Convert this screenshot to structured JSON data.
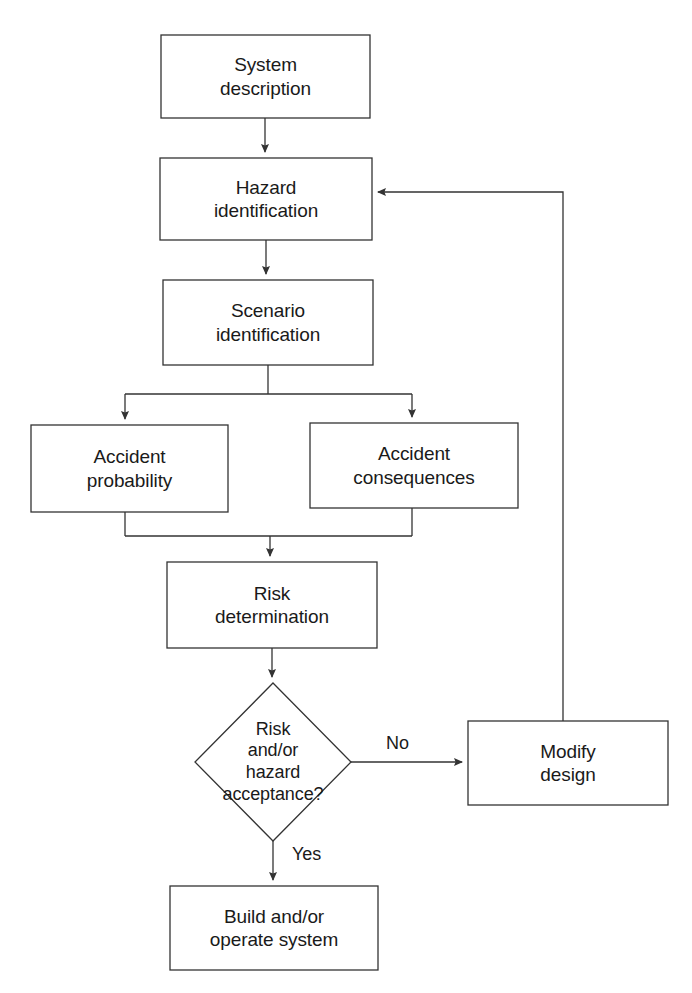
{
  "diagram": {
    "type": "flowchart",
    "stroke_color": "#333333",
    "fill_color": "#ffffff",
    "text_color": "#1a1a1a",
    "background_color": "#ffffff"
  },
  "nodes": {
    "system_description": {
      "label": "System\ndescription",
      "line1": "System",
      "line2": "description",
      "shape": "rectangle",
      "x": 161,
      "y": 35,
      "w": 209,
      "h": 83
    },
    "hazard_identification": {
      "label": "Hazard\nidentification",
      "line1": "Hazard",
      "line2": "identification",
      "shape": "rectangle",
      "x": 160,
      "y": 158,
      "w": 212,
      "h": 82
    },
    "scenario_identification": {
      "label": "Scenario\nidentification",
      "line1": "Scenario",
      "line2": "identification",
      "shape": "rectangle",
      "x": 163,
      "y": 280,
      "w": 210,
      "h": 85
    },
    "accident_probability": {
      "label": "Accident\nprobability",
      "line1": "Accident",
      "line2": "probability",
      "shape": "rectangle",
      "x": 31,
      "y": 425,
      "w": 197,
      "h": 87
    },
    "accident_consequences": {
      "label": "Accident\nconsequences",
      "line1": "Accident",
      "line2": "consequences",
      "shape": "rectangle",
      "x": 310,
      "y": 423,
      "w": 208,
      "h": 85
    },
    "risk_determination": {
      "label": "Risk\ndetermination",
      "line1": "Risk",
      "line2": "determination",
      "shape": "rectangle",
      "x": 167,
      "y": 562,
      "w": 210,
      "h": 86
    },
    "risk_acceptance_decision": {
      "label": "Risk\nand/or\nhazard\nacceptance?",
      "line1": "Risk",
      "line2": "and/or",
      "line3": "hazard",
      "line4": "acceptance?",
      "shape": "diamond",
      "cx": 273,
      "cy": 762,
      "rx": 78,
      "ry": 79
    },
    "modify_design": {
      "label": "Modify\ndesign",
      "line1": "Modify",
      "line2": "design",
      "shape": "rectangle",
      "x": 468,
      "y": 721,
      "w": 200,
      "h": 84
    },
    "build_operate_system": {
      "label": "Build and/or\noperate system",
      "line1": "Build and/or",
      "line2": "operate system",
      "shape": "rectangle",
      "x": 170,
      "y": 886,
      "w": 208,
      "h": 84
    }
  },
  "edge_labels": {
    "no": "No",
    "yes": "Yes"
  },
  "edges": [
    {
      "from": "system_description",
      "to": "hazard_identification",
      "label": ""
    },
    {
      "from": "hazard_identification",
      "to": "scenario_identification",
      "label": ""
    },
    {
      "from": "scenario_identification",
      "to": "accident_probability",
      "label": ""
    },
    {
      "from": "scenario_identification",
      "to": "accident_consequences",
      "label": ""
    },
    {
      "from": "accident_probability",
      "to": "risk_determination",
      "label": ""
    },
    {
      "from": "accident_consequences",
      "to": "risk_determination",
      "label": ""
    },
    {
      "from": "risk_determination",
      "to": "risk_acceptance_decision",
      "label": ""
    },
    {
      "from": "risk_acceptance_decision",
      "to": "modify_design",
      "label": "No"
    },
    {
      "from": "risk_acceptance_decision",
      "to": "build_operate_system",
      "label": "Yes"
    },
    {
      "from": "modify_design",
      "to": "hazard_identification",
      "label": ""
    }
  ]
}
